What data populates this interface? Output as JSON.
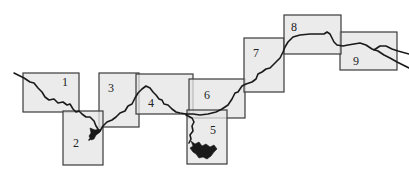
{
  "diagram": {
    "type": "map-index",
    "colors": {
      "panel_fill": "#e4e4e4",
      "panel_border": "#3a3a3a",
      "river": "#1a1a1a",
      "background": "#ffffff"
    },
    "panels": [
      {
        "id": "1",
        "label": "1",
        "x": 23,
        "y": 73,
        "w": 56,
        "h": 39
      },
      {
        "id": "2",
        "label": "2",
        "x": 63,
        "y": 111,
        "w": 40,
        "h": 54
      },
      {
        "id": "3",
        "label": "3",
        "x": 99,
        "y": 73,
        "w": 40,
        "h": 54
      },
      {
        "id": "4",
        "label": "4",
        "x": 136,
        "y": 74,
        "w": 57,
        "h": 40
      },
      {
        "id": "5",
        "label": "5",
        "x": 187,
        "y": 110,
        "w": 40,
        "h": 54
      },
      {
        "id": "6",
        "label": "6",
        "x": 189,
        "y": 79,
        "w": 56,
        "h": 39
      },
      {
        "id": "7",
        "label": "7",
        "x": 244,
        "y": 38,
        "w": 40,
        "h": 54
      },
      {
        "id": "8",
        "label": "8",
        "x": 284,
        "y": 15,
        "w": 57,
        "h": 39
      },
      {
        "id": "9",
        "label": "9",
        "x": 340,
        "y": 32,
        "w": 57,
        "h": 38
      }
    ]
  }
}
